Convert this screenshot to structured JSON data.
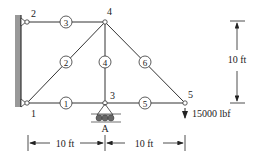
{
  "nodes": [
    {
      "id": "1",
      "label": "1"
    },
    {
      "id": "2",
      "label": "2"
    },
    {
      "id": "3",
      "label": "3"
    },
    {
      "id": "4",
      "label": "4"
    },
    {
      "id": "5",
      "label": "5"
    }
  ],
  "members": [
    {
      "label": "1"
    },
    {
      "label": "2"
    },
    {
      "label": "3"
    },
    {
      "label": "4"
    },
    {
      "label": "5"
    },
    {
      "label": "6"
    }
  ],
  "support_label": "A",
  "load": {
    "value": "15000 lbf"
  },
  "dimensions": {
    "height": "10 ft",
    "left_span": "10 ft",
    "right_span": "10 ft"
  }
}
